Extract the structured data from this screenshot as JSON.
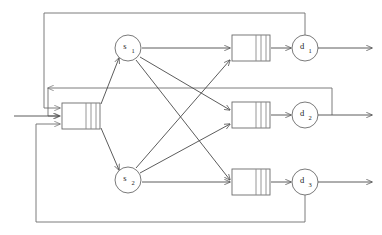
{
  "diagram": {
    "type": "queueing-network",
    "canvas": {
      "width": 382,
      "height": 235
    },
    "colors": {
      "background": "#ffffff",
      "edge": "#4a4a4a",
      "loop": "#6d6d6d",
      "outline": "#6b6b6b",
      "divider": "#8a8a8a",
      "label": "#1d1d1d"
    },
    "servers": [
      {
        "id": "s1",
        "base": "s",
        "subscript": "1",
        "cx": 128,
        "cy": 48,
        "r": 13
      },
      {
        "id": "s2",
        "base": "s",
        "subscript": "2",
        "cx": 128,
        "cy": 180,
        "r": 13
      }
    ],
    "departures": [
      {
        "id": "d1",
        "base": "d",
        "subscript": "1",
        "cx": 305,
        "cy": 48,
        "r": 13
      },
      {
        "id": "d2",
        "base": "d",
        "subscript": "2",
        "cx": 305,
        "cy": 115,
        "r": 13
      },
      {
        "id": "d3",
        "base": "d",
        "subscript": "3",
        "cx": 305,
        "cy": 182,
        "r": 13
      }
    ],
    "queues": [
      {
        "id": "input-queue",
        "x": 62,
        "y": 103,
        "w": 38,
        "h": 26,
        "dividers": 3
      },
      {
        "id": "output-queue-1",
        "x": 232,
        "y": 35,
        "w": 38,
        "h": 26,
        "dividers": 3
      },
      {
        "id": "output-queue-2",
        "x": 232,
        "y": 102,
        "w": 38,
        "h": 26,
        "dividers": 3
      },
      {
        "id": "output-queue-3",
        "x": 232,
        "y": 169,
        "w": 38,
        "h": 26,
        "dividers": 3
      }
    ],
    "arrivals": [
      {
        "id": "arrival-top",
        "from_x": 30,
        "from_y": 108,
        "to_x": 61,
        "to_y": 108
      },
      {
        "id": "arrival-middle",
        "from_x": 18,
        "from_y": 116,
        "to_x": 61,
        "to_y": 116
      },
      {
        "id": "arrival-bottom",
        "from_x": 30,
        "from_y": 124,
        "to_x": 61,
        "to_y": 124
      }
    ],
    "departure_outputs": [
      {
        "id": "exit-1",
        "from_x": 318,
        "from_y": 48,
        "to_x": 372,
        "to_y": 48
      },
      {
        "id": "exit-2",
        "from_x": 318,
        "from_y": 115,
        "to_x": 372,
        "to_y": 115
      },
      {
        "id": "exit-3",
        "from_x": 318,
        "from_y": 182,
        "to_x": 372,
        "to_y": 182
      }
    ],
    "routing_edges": [
      {
        "id": "s1-to-q1",
        "from": "s1",
        "to": "output-queue-1"
      },
      {
        "id": "s1-to-q2",
        "from": "s1",
        "to": "output-queue-2"
      },
      {
        "id": "s1-to-q3",
        "from": "s1",
        "to": "output-queue-3"
      },
      {
        "id": "s2-to-q1",
        "from": "s2",
        "to": "output-queue-1"
      },
      {
        "id": "s2-to-q2",
        "from": "s2",
        "to": "output-queue-2"
      },
      {
        "id": "s2-to-q3",
        "from": "s2",
        "to": "output-queue-3"
      },
      {
        "id": "inputq-to-s1",
        "from": "input-queue",
        "to": "s1"
      },
      {
        "id": "inputq-to-s2",
        "from": "input-queue",
        "to": "s2"
      },
      {
        "id": "q1-to-d1",
        "from": "output-queue-1",
        "to": "d1"
      },
      {
        "id": "q2-to-d2",
        "from": "output-queue-2",
        "to": "d2"
      },
      {
        "id": "q3-to-d3",
        "from": "output-queue-3",
        "to": "d3"
      }
    ],
    "feedback_loops": [
      {
        "id": "feedback-top",
        "from": "d1",
        "to": "input-queue",
        "path": "top"
      },
      {
        "id": "feedback-middle",
        "from": "d2",
        "to": "input-queue",
        "path": "middle"
      },
      {
        "id": "feedback-bottom",
        "from": "d3",
        "to": "input-queue",
        "path": "bottom"
      }
    ]
  }
}
